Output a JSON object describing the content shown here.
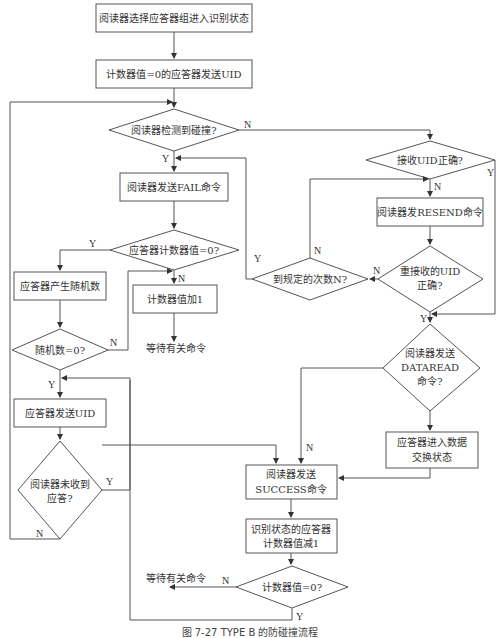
{
  "nodes": {
    "start": "阅读器选择应答器组进入识别状态",
    "send_uid_zero": "计数器值=0的应答器发送UID",
    "collision_q": "阅读器检测到碰撞?",
    "send_fail": "阅读器发送FAIL命令",
    "counter_zero_q": "应答器计数器值=0?",
    "gen_random": "应答器产生随机数",
    "counter_inc": "计数器值加1",
    "wait_cmd_1": "等待有关命令",
    "random_zero_q": "随机数=0?",
    "send_uid": "应答器发送UID",
    "no_reply_q_l1": "阅读器未收到",
    "no_reply_q_l2": "应答?",
    "recv_uid_ok_q": "接收UID正确?",
    "send_resend": "阅读器发RESEND命令",
    "reach_n_q": "到规定的次数N?",
    "re_recv_ok_q_l1": "重接收的UID",
    "re_recv_ok_q_l2": "正确?",
    "dataread_q_l1": "阅读器发送",
    "dataread_q_l2": "DATAREAD",
    "dataread_q_l3": "命令?",
    "enter_exchange_l1": "应答器进入数据",
    "enter_exchange_l2": "交换状态",
    "send_success_l1": "阅读器发送",
    "send_success_l2": "SUCCESS命令",
    "dec_counter_l1": "识别状态的应答器",
    "dec_counter_l2": "计数器值减1",
    "counter_val_zero_q": "计数器值=0?",
    "wait_cmd_2": "等待有关命令"
  },
  "edge_labels": {
    "yes": "Y",
    "no": "N"
  },
  "caption": "图 7-27  TYPE B 的防碰撞流程"
}
